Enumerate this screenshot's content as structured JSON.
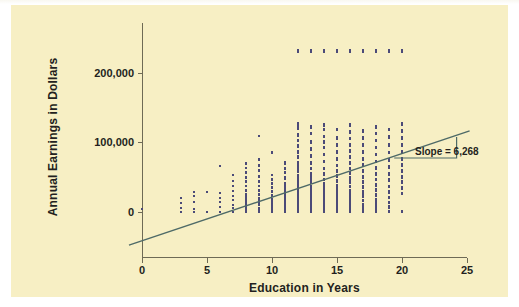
{
  "figure": {
    "background_color": "#f7efc4",
    "page_color": "#ffffff"
  },
  "chart_data": {
    "type": "scatter",
    "title": "",
    "xlabel": "Education in Years",
    "ylabel": "Annual Earnings in Dollars",
    "xlim": [
      -1,
      26
    ],
    "ylim": [
      -60000,
      245000
    ],
    "grid": false,
    "legend": null,
    "x_ticks": [
      0,
      5,
      10,
      15,
      20,
      25
    ],
    "x_ticklabels": [
      "0",
      "5",
      "10",
      "15",
      "20",
      "25"
    ],
    "y_ticks": [
      0,
      100000,
      200000
    ],
    "y_ticklabels": [
      "0",
      "100,000",
      "200,000"
    ],
    "point_color": "#4b4a78",
    "line_color": "#4e6a67",
    "annotation": {
      "text": "Slope = 6,268",
      "slope_value": 6268,
      "triangle": {
        "x_start": 19.4,
        "x_end": 24.2,
        "y_base": 77000,
        "y_top": 107000
      }
    },
    "regression_line": {
      "intercept": -42000,
      "slope": 6268,
      "x_from": -1.0,
      "x_to": 25.2
    },
    "topcoded_row": {
      "y": 231000,
      "x_values": [
        12,
        13,
        14,
        15,
        16,
        17,
        18,
        19,
        20
      ],
      "note": "row of topcoded earnings observations"
    },
    "series": [
      {
        "name": "Respondents",
        "description": "Each point is one respondent: education in years vs annual earnings in dollars",
        "columns": [
          {
            "x": 0,
            "y_values": [
              3000
            ]
          },
          {
            "x": 3,
            "y_values": [
              0,
              5000,
              12000,
              20000
            ]
          },
          {
            "x": 4,
            "y_values": [
              0,
              4000,
              14000,
              22000,
              28000
            ]
          },
          {
            "x": 5,
            "y_values": [
              0,
              28000
            ]
          },
          {
            "x": 6,
            "y_values": [
              0,
              6000,
              14000,
              20000,
              26000,
              66000
            ]
          },
          {
            "x": 7,
            "y_values": [
              0,
              5000,
              10000,
              16000,
              22000,
              30000,
              36000,
              44000,
              52000
            ]
          },
          {
            "x": 8,
            "y_values": [
              0,
              4000,
              8000,
              12000,
              16000,
              20000,
              24000,
              30000,
              36000,
              42000,
              48000,
              56000,
              62000,
              68000
            ]
          },
          {
            "x": 9,
            "y_values": [
              0,
              4000,
              9000,
              14000,
              18000,
              24000,
              30000,
              36000,
              42000,
              50000,
              58000,
              66000,
              74000,
              108000
            ]
          },
          {
            "x": 10,
            "y_values": [
              0,
              4000,
              8000,
              12000,
              17000,
              22000,
              28000,
              34000,
              40000,
              46000,
              52000,
              84000
            ]
          },
          {
            "x": 11,
            "y_values": [
              0,
              4000,
              8000,
              13000,
              18000,
              23000,
              28000,
              34000,
              40000,
              48000,
              56000,
              62000,
              70000
            ]
          },
          {
            "x": 12,
            "y_values": [
              0,
              3000,
              6000,
              9000,
              12000,
              15000,
              18000,
              21000,
              25000,
              29000,
              33000,
              37000,
              42000,
              47000,
              52000,
              58000,
              64000,
              70000,
              78000,
              86000,
              94000,
              102000,
              110000,
              120000,
              126000,
              231000
            ]
          },
          {
            "x": 13,
            "y_values": [
              0,
              4000,
              8000,
              12000,
              16000,
              21000,
              26000,
              31000,
              36000,
              42000,
              48000,
              54000,
              62000,
              70000,
              80000,
              90000,
              100000,
              112000,
              122000,
              231000
            ]
          },
          {
            "x": 14,
            "y_values": [
              0,
              4000,
              8000,
              13000,
              18000,
              23000,
              28000,
              34000,
              40000,
              46000,
              54000,
              62000,
              72000,
              82000,
              92000,
              100000,
              108000,
              118000,
              124000,
              231000
            ]
          },
          {
            "x": 15,
            "y_values": [
              0,
              4000,
              9000,
              14000,
              19000,
              25000,
              31000,
              37000,
              44000,
              51000,
              58000,
              66000,
              76000,
              86000,
              96000,
              106000,
              118000,
              231000
            ]
          },
          {
            "x": 16,
            "y_values": [
              0,
              3000,
              7000,
              11000,
              15000,
              20000,
              25000,
              30000,
              36000,
              42000,
              48000,
              55000,
              62000,
              70000,
              78000,
              87000,
              96000,
              105000,
              114000,
              124000,
              231000
            ]
          },
          {
            "x": 17,
            "y_values": [
              0,
              5000,
              10000,
              16000,
              22000,
              28000,
              35000,
              42000,
              50000,
              58000,
              67000,
              76000,
              86000,
              96000,
              106000,
              116000,
              231000
            ]
          },
          {
            "x": 18,
            "y_values": [
              0,
              5000,
              11000,
              17000,
              24000,
              31000,
              38000,
              46000,
              54000,
              63000,
              72000,
              82000,
              92000,
              102000,
              112000,
              122000,
              231000
            ]
          },
          {
            "x": 19,
            "y_values": [
              0,
              6000,
              13000,
              20000,
              28000,
              36000,
              45000,
              54000,
              64000,
              74000,
              85000,
              96000,
              107000,
              118000,
              231000
            ]
          },
          {
            "x": 20,
            "y_values": [
              0,
              26000,
              34000,
              42000,
              50000,
              58000,
              67000,
              76000,
              86000,
              96000,
              106000,
              116000,
              126000,
              231000
            ]
          }
        ]
      }
    ]
  }
}
